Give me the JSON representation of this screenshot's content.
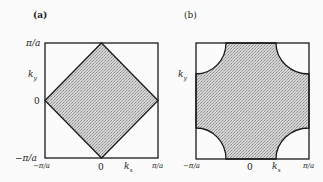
{
  "panels": [
    {
      "label": "(a)",
      "ylabel": "k_y",
      "ylabel_main": "k",
      "ylabel_sub": "y",
      "xlabel_main": "k",
      "xlabel_sub": "x",
      "yticks": [
        "π/a",
        "0",
        "−π/a"
      ],
      "xticks": [
        "−π/a",
        "0",
        "π/a"
      ],
      "shape": "diamond (half-filled Fermi surface)"
    },
    {
      "label": "(b)",
      "ylabel_main": "k",
      "ylabel_sub": "y",
      "xlabel_main": "k",
      "xlabel_sub": "x",
      "xticks": [
        "−π/a",
        "0",
        "π/a"
      ],
      "shape": "square with quarter-circle corner pockets"
    }
  ],
  "colors": {
    "fill": "#c4c4c4",
    "stroke": "#1a1a1a",
    "background": "#fbfbfb"
  }
}
